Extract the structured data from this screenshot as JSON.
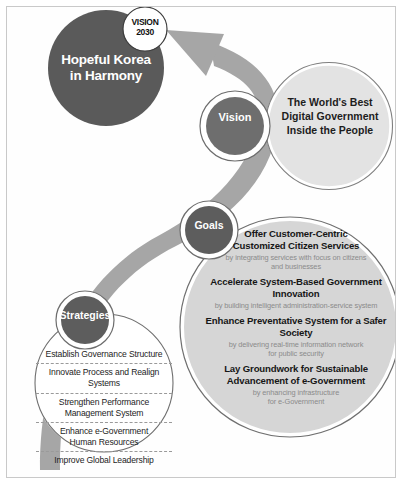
{
  "diagram": {
    "title_circle": {
      "badge": "VISION\n2030",
      "badge_line1": "VISION",
      "badge_line2": "2030",
      "label": "Hopeful Korea\nin Harmony",
      "label_line1": "Hopeful Korea",
      "label_line2": "in Harmony",
      "fill": "#5a5a5a",
      "text_color": "#ffffff"
    },
    "vision": {
      "pill_label": "Vision",
      "body_line1": "The World's Best",
      "body_line2": "Digital Government",
      "body_line3": "Inside the People",
      "pill_fill": "#6e6e6e",
      "circle_fill": "#e3e3e3"
    },
    "goals": {
      "pill_label": "Goals",
      "pill_fill": "#5d5d5d",
      "circle_fill": "#d6d6d6",
      "items": [
        {
          "title_line1": "Offer Customer-Centric",
          "title_line2": "Customized Citizen Services",
          "sub_line1": "by integrating services with focus on citizens",
          "sub_line2": "and businesses"
        },
        {
          "title_line1": "Accelerate System-Based Government",
          "title_line2": "Innovation",
          "sub_line1": "by building intelligent administration-service system",
          "sub_line2": ""
        },
        {
          "title_line1": "Enhance Preventative System for a Safer Society",
          "title_line2": "",
          "sub_line1": "by delivering real-time information network",
          "sub_line2": "for public security"
        },
        {
          "title_line1": "Lay Groundwork for Sustainable",
          "title_line2": "Advancement of e-Government",
          "sub_line1": "by enhancing infrastructure",
          "sub_line2": "for e-Government"
        }
      ]
    },
    "strategies": {
      "pill_label": "Strategies",
      "pill_fill": "#5d5d5d",
      "circle_fill": "#ffffff",
      "items": [
        {
          "line1": "Establish Governance Structure",
          "line2": ""
        },
        {
          "line1": "Innovate Process and Realign Systems",
          "line2": ""
        },
        {
          "line1": "Strengthen Performance",
          "line2": "Management System"
        },
        {
          "line1": "Enhance e-Government",
          "line2": "Human Resources"
        },
        {
          "line1": "Improve Global Leadership",
          "line2": ""
        }
      ]
    },
    "arrow": {
      "name": "upward-curved-arrow",
      "fill": "#a6a6a6"
    },
    "colors": {
      "page_background": "#ffffff",
      "frame_border": "#c9c9c9",
      "ribbon": "#a6a6a6",
      "subtext": "#8b8b8b",
      "body_text": "#1d1d1d"
    }
  }
}
